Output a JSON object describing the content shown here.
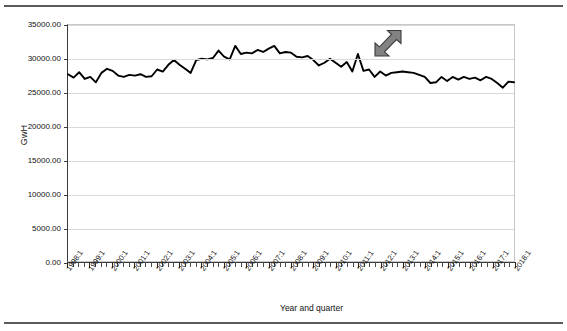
{
  "figure": {
    "top_rule": "horizontal-rule",
    "bottom_rule": "horizontal-rule"
  },
  "chart_data": {
    "type": "line",
    "title": "",
    "xlabel": "Year and quarter",
    "ylabel": "GwH",
    "ylim": [
      0,
      35000
    ],
    "ytick_labels": [
      "35000.00",
      "30000.00",
      "25000.00",
      "20000.00",
      "15000.00",
      "10000.00",
      "5000.00",
      "0.00"
    ],
    "ytick_values": [
      35000,
      30000,
      25000,
      20000,
      15000,
      10000,
      5000,
      0
    ],
    "grid": true,
    "legend": null,
    "xtick_labels": [
      "1998:1",
      "1999:1",
      "2000:1",
      "2001:1",
      "2002:1",
      "2003:1",
      "2004:1",
      "2005:1",
      "2006:1",
      "2007:1",
      "2008:1",
      "2009:1",
      "2010:1",
      "2011:1",
      "2012:1",
      "2013:1",
      "2014:1",
      "2015:1",
      "2016:1",
      "2017:1",
      "2018:1"
    ],
    "x_minor_per_major": 4,
    "series_name": "Electricity generation",
    "series_color": "#000000",
    "x": [
      "1998:1",
      "1998:2",
      "1998:3",
      "1998:4",
      "1999:1",
      "1999:2",
      "1999:3",
      "1999:4",
      "2000:1",
      "2000:2",
      "2000:3",
      "2000:4",
      "2001:1",
      "2001:2",
      "2001:3",
      "2001:4",
      "2002:1",
      "2002:2",
      "2002:3",
      "2002:4",
      "2003:1",
      "2003:2",
      "2003:3",
      "2003:4",
      "2004:1",
      "2004:2",
      "2004:3",
      "2004:4",
      "2005:1",
      "2005:2",
      "2005:3",
      "2005:4",
      "2006:1",
      "2006:2",
      "2006:3",
      "2006:4",
      "2007:1",
      "2007:2",
      "2007:3",
      "2007:4",
      "2008:1",
      "2008:2",
      "2008:3",
      "2008:4",
      "2009:1",
      "2009:2",
      "2009:3",
      "2009:4",
      "2010:1",
      "2010:2",
      "2010:3",
      "2010:4",
      "2011:1",
      "2011:2",
      "2011:3",
      "2011:4",
      "2012:1",
      "2012:2",
      "2012:3",
      "2012:4",
      "2013:1",
      "2013:2",
      "2013:3",
      "2013:4",
      "2014:1",
      "2014:2",
      "2014:3",
      "2014:4",
      "2015:1",
      "2015:2",
      "2015:3",
      "2015:4",
      "2016:1",
      "2016:2",
      "2016:3",
      "2016:4",
      "2017:1",
      "2017:2",
      "2017:3",
      "2017:4",
      "2018:1"
    ],
    "values": [
      27700,
      27200,
      28000,
      27000,
      27300,
      26500,
      27900,
      28500,
      28200,
      27500,
      27300,
      27600,
      27500,
      27700,
      27300,
      27400,
      28400,
      28100,
      29100,
      29800,
      29100,
      28500,
      27900,
      29800,
      30000,
      29900,
      30100,
      31200,
      30300,
      29900,
      31900,
      30700,
      30900,
      30800,
      31300,
      31000,
      31500,
      31900,
      30800,
      31000,
      30900,
      30300,
      30200,
      30400,
      29800,
      29000,
      29400,
      30000,
      29400,
      28800,
      29500,
      28100,
      30700,
      28200,
      28400,
      27300,
      28100,
      27500,
      27900,
      28000,
      28100,
      28000,
      27900,
      27600,
      27300,
      26400,
      26500,
      27300,
      26700,
      27300,
      26900,
      27300,
      27000,
      27200,
      26800,
      27300,
      27000,
      26400,
      25700,
      26600,
      26500
    ]
  },
  "annotations": [
    {
      "name": "arrow-annotation",
      "shape": "arrow",
      "color": "#7a7a7a",
      "points_to": "2011:1",
      "direction": "down-left"
    }
  ]
}
